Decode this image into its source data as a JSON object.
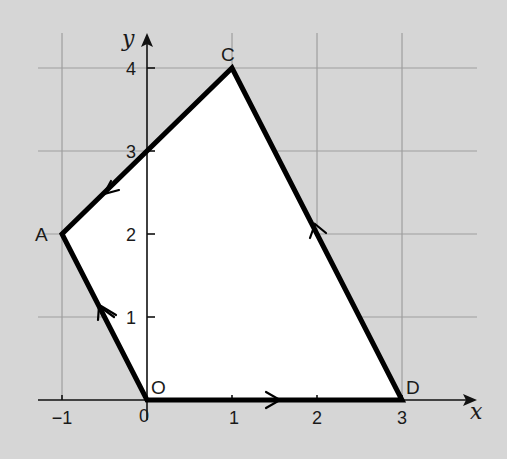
{
  "colors": {
    "background": "#d6d6d6",
    "grid": "#9e9e9e",
    "region_fill": "#ffffff",
    "outline": "#000000",
    "text": "#1a1a1a"
  },
  "axes": {
    "x_label": "x",
    "y_label": "y",
    "x_ticks": [
      {
        "value": -1,
        "label": "−1"
      },
      {
        "value": 0,
        "label": "0"
      },
      {
        "value": 1,
        "label": "1"
      },
      {
        "value": 2,
        "label": "2"
      },
      {
        "value": 3,
        "label": "3"
      }
    ],
    "y_ticks": [
      {
        "value": 1,
        "label": "1"
      },
      {
        "value": 2,
        "label": "2"
      },
      {
        "value": 3,
        "label": "3"
      },
      {
        "value": 4,
        "label": "4"
      }
    ]
  },
  "polygon": {
    "vertices": [
      {
        "name": "O",
        "x": 0,
        "y": 0
      },
      {
        "name": "D",
        "x": 3,
        "y": 0
      },
      {
        "name": "C",
        "x": 1,
        "y": 4
      },
      {
        "name": "A",
        "x": -1,
        "y": 2
      }
    ],
    "direction": "O → D → C → A → O (anticlockwise)",
    "edge_crosses_y_axis_at": 3
  },
  "labels": {
    "O": "O",
    "A": "A",
    "C": "C",
    "D": "D",
    "x": "x",
    "y": "y",
    "xt_m1": "−1",
    "xt_0": "0",
    "xt_1": "1",
    "xt_2": "2",
    "xt_3": "3",
    "yt_1": "1",
    "yt_2": "2",
    "yt_3": "3",
    "yt_4": "4"
  }
}
